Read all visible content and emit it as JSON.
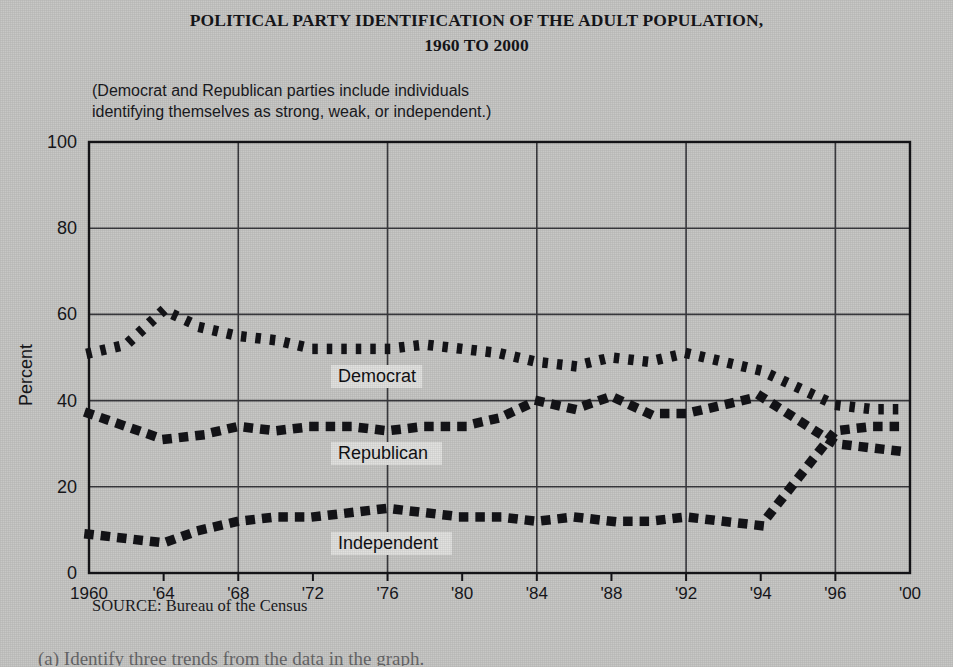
{
  "title": {
    "line1": "POLITICAL PARTY IDENTIFICATION OF THE ADULT POPULATION,",
    "line2": "1960 TO 2000"
  },
  "subtitle": {
    "line1": "(Democrat and Republican parties include individuals",
    "line2": "identifying themselves as strong, weak, or independent.)"
  },
  "source_note": "SOURCE: Bureau of the Census",
  "question_text": "(a)  Identify three trends from the data in the graph.",
  "axis": {
    "y_label": "Percent",
    "y_ticks": [
      "0",
      "20",
      "40",
      "60",
      "80",
      "100"
    ],
    "x_ticks": [
      "1960",
      "'64",
      "'68",
      "'72",
      "'76",
      "'80",
      "'84",
      "'88",
      "'92",
      "'94",
      "'96",
      "'00"
    ]
  },
  "series_labels": {
    "democrat": "Democrat",
    "republican": "Republican",
    "independent": "Independent"
  },
  "colors": {
    "background": "#c8c8c6",
    "ink": "#141418",
    "grid": "#3a3a3e",
    "label_box": "#e2e2e0"
  },
  "chart_data": {
    "type": "line",
    "title": "POLITICAL PARTY IDENTIFICATION OF THE ADULT POPULATION, 1960 TO 2000",
    "subtitle": "(Democrat and Republican parties include individuals identifying themselves as strong, weak, or independent.)",
    "xlabel": "",
    "ylabel": "Percent",
    "ylim": [
      0,
      100
    ],
    "ytick_interval": 20,
    "grid": true,
    "legend_position": "inline-annotations",
    "x": [
      1960,
      1962,
      1964,
      1966,
      1968,
      1970,
      1972,
      1974,
      1976,
      1978,
      1980,
      1982,
      1984,
      1986,
      1988,
      1990,
      1992,
      1994,
      1996,
      1998,
      2000
    ],
    "x_tick_labels": [
      "1960",
      "'64",
      "'68",
      "'72",
      "'76",
      "'80",
      "'84",
      "'88",
      "'92",
      "'94",
      "'96",
      "'00"
    ],
    "x_tick_values": [
      1960,
      1964,
      1968,
      1972,
      1976,
      1980,
      1984,
      1988,
      1992,
      1994,
      1996,
      2000
    ],
    "series": [
      {
        "name": "Democrat",
        "style": "dotted",
        "values": [
          51,
          53,
          61,
          57,
          55,
          54,
          52,
          52,
          52,
          53,
          52,
          51,
          49,
          48,
          50,
          49,
          51,
          47,
          39,
          38,
          38
        ]
      },
      {
        "name": "Republican",
        "style": "dashed-square",
        "values": [
          37,
          34,
          31,
          32,
          34,
          33,
          34,
          34,
          33,
          34,
          34,
          36,
          40,
          38,
          41,
          37,
          37,
          41,
          30,
          29,
          28
        ]
      },
      {
        "name": "Independent",
        "style": "dashed-square",
        "values": [
          9,
          8,
          7,
          10,
          12,
          13,
          13,
          14,
          15,
          14,
          13,
          13,
          12,
          13,
          12,
          12,
          13,
          11,
          33,
          34,
          34
        ]
      }
    ]
  }
}
